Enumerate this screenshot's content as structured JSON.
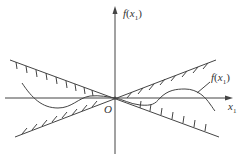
{
  "figure": {
    "y_axis_label": {
      "fn": "f",
      "open": "(",
      "var": "x",
      "sub": "1",
      "close": ")"
    },
    "x_axis_label": {
      "var": "x",
      "sub": "1"
    },
    "origin_label": "O",
    "curve_label": {
      "fn": "f",
      "open": "(",
      "var": "x",
      "sub": "1",
      "close": ")"
    },
    "colors": {
      "stroke": "#444444",
      "background": "#ffffff"
    },
    "elements": [
      "vertical axis f(x1) with arrow",
      "horizontal axis x1 with arrow",
      "two straight boundary lines crossing at origin O with hatching",
      "curve f(x1) confined between the boundary lines"
    ]
  }
}
